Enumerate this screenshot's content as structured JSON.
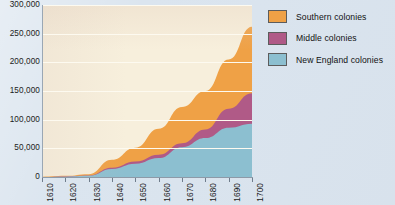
{
  "chart_data": {
    "type": "area",
    "stacked": true,
    "title": "",
    "xlabel": "",
    "ylabel": "",
    "x": [
      1610,
      1620,
      1630,
      1640,
      1650,
      1660,
      1670,
      1680,
      1690,
      1700
    ],
    "xlim": [
      1610,
      1700
    ],
    "ylim": [
      0,
      300000
    ],
    "grid": true,
    "legend_position": "right",
    "ytick_labels": [
      "300,000",
      "250,000",
      "200,000",
      "150,000",
      "100,000",
      "50,000",
      "0"
    ],
    "ytick_values": [
      300000,
      250000,
      200000,
      150000,
      100000,
      50000,
      0
    ],
    "xtick_labels": [
      "1610",
      "1620",
      "1630",
      "1640",
      "1650",
      "1660",
      "1670",
      "1680",
      "1690",
      "1700"
    ],
    "series": [
      {
        "name": "New England colonies",
        "color": "#8cbfd0",
        "values": [
          0,
          500,
          2000,
          14000,
          23000,
          33000,
          52000,
          68000,
          86000,
          93000
        ]
      },
      {
        "name": "Middle colonies",
        "color": "#b05a87",
        "values": [
          0,
          500,
          500,
          2000,
          4000,
          6000,
          7000,
          15000,
          33000,
          53000
        ]
      },
      {
        "name": "Southern colonies",
        "color": "#efa146",
        "values": [
          500,
          1000,
          2500,
          14000,
          24000,
          45000,
          63000,
          67000,
          86000,
          116000
        ]
      }
    ],
    "legend_entries": [
      {
        "label": "Southern colonies",
        "color": "#efa146"
      },
      {
        "label": "Middle colonies",
        "color": "#b05a87"
      },
      {
        "label": "New England colonies",
        "color": "#8cbfd0"
      }
    ],
    "colors": {
      "page_background": "#dbe5ef",
      "plot_background": "#f7efdc",
      "gridline": "#fdfaf0",
      "axis": "#8d9aa8",
      "text": "#1b1b1b"
    }
  }
}
